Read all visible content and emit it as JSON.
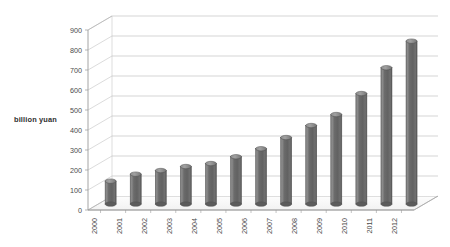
{
  "chart_data": {
    "type": "bar",
    "title": "",
    "subtitle": "",
    "xlabel": "",
    "ylabel": "billion yuan",
    "categories": [
      "2000",
      "2001",
      "2002",
      "2003",
      "2004",
      "2005",
      "2006",
      "2007",
      "2008",
      "2009",
      "2010",
      "2011",
      "2012"
    ],
    "values": [
      115,
      150,
      168,
      188,
      203,
      237,
      277,
      333,
      393,
      448,
      553,
      682,
      815
    ],
    "series": [
      {
        "name": "billion yuan",
        "values": [
          115,
          150,
          168,
          188,
          203,
          237,
          277,
          333,
          393,
          448,
          553,
          682,
          815
        ]
      }
    ],
    "ylim": [
      0,
      900
    ],
    "yticks": [
      0,
      100,
      200,
      300,
      400,
      500,
      600,
      700,
      800,
      900
    ],
    "ytick_labels": [
      "0",
      "100",
      "200",
      "300",
      "400",
      "500",
      "600",
      "700",
      "800",
      "900"
    ],
    "grid": true,
    "grid_axis": "y",
    "legend": false,
    "legend_position": "none",
    "style": "3d-cylinder",
    "bar_color": "#6e6e6e",
    "bar_edge_color": "#4f4f4f",
    "grid_color": "#b3b3b3",
    "axis_color": "#9a9a9a",
    "background_color": "#ffffff",
    "xtick_rotation": -90,
    "annotations": []
  }
}
